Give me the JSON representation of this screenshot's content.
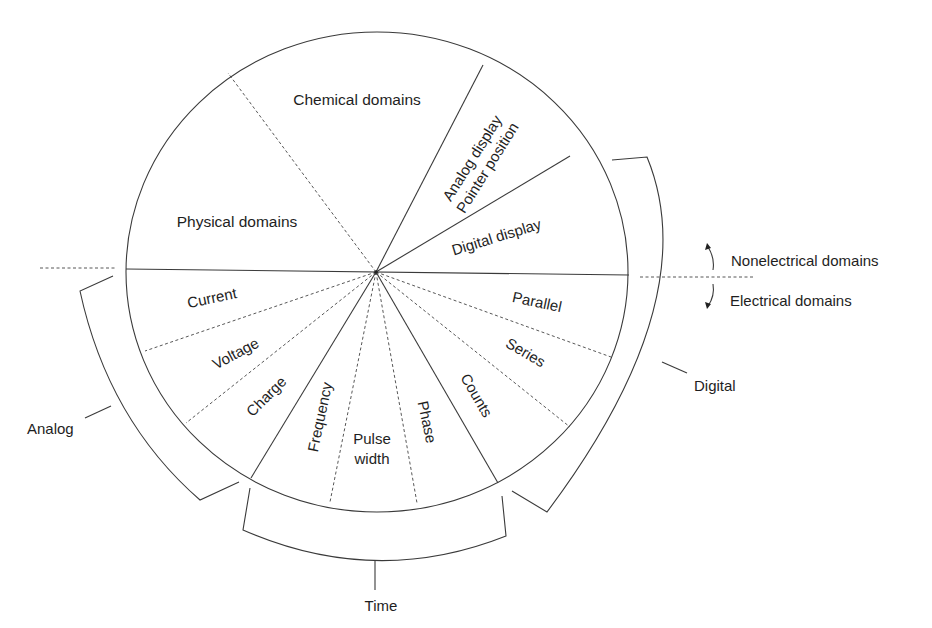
{
  "diagram": {
    "type": "domain-wheel",
    "upper_sectors": {
      "physical": "Physical domains",
      "chemical": "Chemical domains",
      "analog_display_line1": "Analog display",
      "analog_display_line2": "Pointer position",
      "digital_display": "Digital display"
    },
    "lower_sectors": {
      "current": "Current",
      "voltage": "Voltage",
      "charge": "Charge",
      "frequency": "Frequency",
      "pulse_width_line1": "Pulse",
      "pulse_width_line2": "width",
      "phase": "Phase",
      "counts": "Counts",
      "series": "Series",
      "parallel": "Parallel"
    },
    "groups": {
      "analog": "Analog",
      "time": "Time",
      "digital": "Digital"
    },
    "divider_labels": {
      "nonelectrical": "Nonelectrical domains",
      "electrical": "Electrical domains"
    },
    "colors": {
      "line": "#3a3a3a",
      "text": "#1e1e1e",
      "background": "#ffffff"
    }
  }
}
